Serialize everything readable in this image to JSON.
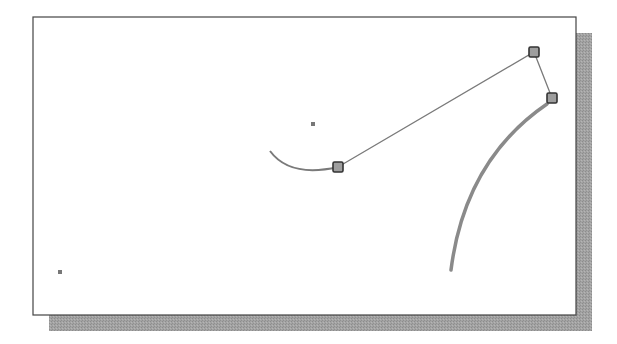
{
  "diagram": {
    "type": "cad-grip-editing-illustration",
    "colors": {
      "background": "#ffffff",
      "frame_border": "#444444",
      "shadow": "#9a9a9a",
      "line": "#7a7a7a",
      "thick_arc": "#8a8a8a",
      "grip_fill": "#9e9e9e",
      "grip_border": "#333333",
      "point": "#777777"
    },
    "frame": {
      "x": 33,
      "y": 17,
      "width": 543,
      "height": 298
    },
    "shadow": {
      "offset_x": 16,
      "offset_y": 16
    },
    "points": [
      {
        "name": "center-point-upper",
        "x": 313,
        "y": 124
      },
      {
        "name": "point-lower-left",
        "x": 60,
        "y": 272
      }
    ],
    "grips": [
      {
        "name": "grip-arc-end",
        "x": 338,
        "y": 167
      },
      {
        "name": "grip-top",
        "x": 534,
        "y": 52
      },
      {
        "name": "grip-right",
        "x": 552,
        "y": 98
      }
    ],
    "thin_arc": {
      "path": "M270,151 Q290,178 338,167"
    },
    "rubber_band": {
      "points": "338,167 534,52 552,98"
    },
    "thick_arc": {
      "path": "M547,104 Q465,160 451,270"
    }
  }
}
